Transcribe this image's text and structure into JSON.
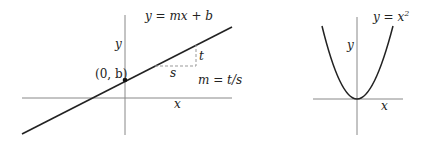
{
  "left_plot": {
    "equation": "y = mx + b",
    "y_axis_label": "y",
    "x_axis_label": "x",
    "intercept_label": "(0, b)",
    "rise_label": "t",
    "run_label": "s",
    "slope_formula": "m = t/s"
  },
  "right_plot": {
    "equation_prefix": "y = x",
    "equation_exponent": "2",
    "y_axis_label": "y",
    "x_axis_label": "x"
  },
  "colors": {
    "axis": "#888888",
    "curve": "#222222",
    "dashed": "#999999"
  }
}
